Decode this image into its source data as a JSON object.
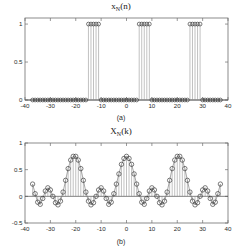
{
  "figure": {
    "background": "#ffffff",
    "marker_color": "#2e2e2e",
    "stem_color": "#8e8e8e",
    "axis_color": "#6f6f6f"
  },
  "panels": [
    {
      "id": "panel-a",
      "caption": "(a)",
      "title_main": "x",
      "title_sub": "N",
      "title_tail": "(n)",
      "title_text": "x_N(n)"
    },
    {
      "id": "panel-b",
      "caption": "(b)",
      "title_main": "X",
      "title_sub": "N",
      "title_tail": "(k)",
      "title_text": "X_N(k)"
    }
  ],
  "chart_data": [
    {
      "type": "line",
      "id": "periodic-square-wave",
      "title": "x_N(n)",
      "xlabel": "",
      "ylabel": "",
      "xlim": [
        -40,
        40
      ],
      "ylim": [
        0,
        1.08
      ],
      "xticks": [
        -40,
        -30,
        -20,
        -10,
        0,
        10,
        20,
        30,
        40
      ],
      "xticklabels": [
        "-40",
        "-30",
        "-20",
        "-10",
        "0",
        "10",
        "20",
        "30",
        "40"
      ],
      "yticks": [
        0,
        0.5,
        1
      ],
      "yticklabels": [
        "0",
        "0.5",
        "1"
      ],
      "grid": false,
      "legend": false,
      "marker": "circle-open",
      "stem": true,
      "caption": "(a)",
      "description": "Periodic rectangular pulse train, period N = 20, pulse width 5 samples centered at multiples of 20.",
      "period": 20,
      "pulse_width": 5,
      "x": [
        -37,
        -36,
        -35,
        -34,
        -33,
        -32,
        -31,
        -30,
        -29,
        -28,
        -27,
        -26,
        -25,
        -24,
        -23,
        -22,
        -21,
        -20,
        -19,
        -18,
        -17,
        -16,
        -15,
        -14,
        -13,
        -12,
        -11,
        -10,
        -9,
        -8,
        -7,
        -6,
        -5,
        -4,
        -3,
        -2,
        -1,
        0,
        1,
        2,
        3,
        4,
        5,
        6,
        7,
        8,
        9,
        10,
        11,
        12,
        13,
        14,
        15,
        16,
        17,
        18,
        19,
        20,
        21,
        22,
        23,
        24,
        25,
        26,
        27,
        28,
        29,
        30,
        31,
        32,
        33,
        34,
        35,
        36,
        37
      ],
      "values": [
        0,
        0,
        0,
        0,
        0,
        0,
        0,
        0,
        0,
        0,
        0,
        0,
        0,
        0,
        0,
        0,
        0,
        0,
        0,
        0,
        0,
        0,
        1,
        1,
        1,
        1,
        1,
        0,
        0,
        0,
        0,
        0,
        0,
        0,
        0,
        0,
        0,
        0,
        0,
        0,
        0,
        0,
        1,
        1,
        1,
        1,
        1,
        0,
        0,
        0,
        0,
        0,
        0,
        0,
        0,
        0,
        0,
        0,
        0,
        0,
        0,
        0,
        1,
        1,
        1,
        1,
        1,
        0,
        0,
        0,
        0,
        0,
        0,
        0,
        0
      ]
    },
    {
      "type": "line",
      "id": "dfs-coefficients",
      "title": "X_N(k)",
      "xlabel": "",
      "ylabel": "",
      "xlim": [
        -40,
        40
      ],
      "ylim": [
        -0.5,
        1.0
      ],
      "xticks": [
        -40,
        -30,
        -20,
        -10,
        0,
        10,
        20,
        30,
        40
      ],
      "xticklabels": [
        "-40",
        "-30",
        "-20",
        "-10",
        "0",
        "10",
        "20",
        "30",
        "40"
      ],
      "yticks": [
        -0.5,
        0,
        0.5,
        1
      ],
      "yticklabels": [
        "-0.5",
        "0",
        "0.5",
        "1"
      ],
      "grid": false,
      "legend": false,
      "marker": "circle-open",
      "stem": true,
      "caption": "(b)",
      "description": "Discrete Fourier Series coefficients: aliased-sinc (Dirichlet) envelope, period 20 in k, main-lobe peak 0.75.",
      "period": 20,
      "peak_value": 0.75,
      "x": [
        -37,
        -36,
        -35,
        -34,
        -33,
        -32,
        -31,
        -30,
        -29,
        -28,
        -27,
        -26,
        -25,
        -24,
        -23,
        -22,
        -21,
        -20,
        -19,
        -18,
        -17,
        -16,
        -15,
        -14,
        -13,
        -12,
        -11,
        -10,
        -9,
        -8,
        -7,
        -6,
        -5,
        -4,
        -3,
        -2,
        -1,
        0,
        1,
        2,
        3,
        4,
        5,
        6,
        7,
        8,
        9,
        10,
        11,
        12,
        13,
        14,
        15,
        16,
        17,
        18,
        19,
        20,
        21,
        22,
        23,
        24,
        25,
        26,
        27,
        28,
        29,
        30,
        31,
        32,
        33,
        34,
        35,
        36,
        37
      ],
      "values": [
        0.23,
        0.05,
        -0.11,
        -0.15,
        -0.04,
        0.1,
        0.16,
        0.12,
        0.0,
        -0.12,
        -0.16,
        -0.09,
        0.08,
        0.3,
        0.52,
        0.68,
        0.75,
        0.75,
        0.68,
        0.52,
        0.3,
        0.08,
        -0.09,
        -0.16,
        -0.12,
        0.0,
        0.12,
        0.16,
        0.1,
        -0.04,
        -0.15,
        -0.11,
        0.05,
        0.23,
        0.42,
        0.6,
        0.71,
        0.75,
        0.71,
        0.6,
        0.42,
        0.23,
        0.05,
        -0.11,
        -0.15,
        -0.04,
        0.1,
        0.16,
        0.12,
        0.0,
        -0.12,
        -0.16,
        -0.09,
        0.08,
        0.3,
        0.52,
        0.68,
        0.75,
        0.75,
        0.68,
        0.52,
        0.3,
        0.08,
        -0.09,
        -0.16,
        -0.12,
        0.0,
        0.12,
        0.16,
        0.1,
        -0.04,
        -0.15,
        -0.11,
        0.05,
        0.23
      ]
    }
  ]
}
